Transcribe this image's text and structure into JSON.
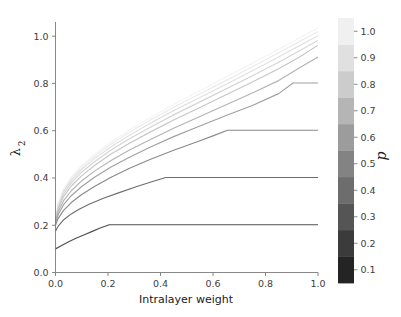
{
  "chart_data": {
    "type": "line",
    "title": "",
    "xlabel": "Intralayer weight",
    "ylabel": "λ2",
    "ylabel_base": "λ",
    "ylabel_sub": "2",
    "xlim": [
      0.0,
      1.0
    ],
    "ylim": [
      0.0,
      1.06
    ],
    "xticks": [
      0.0,
      0.2,
      0.4,
      0.6,
      0.8,
      1.0
    ],
    "xtick_labels": [
      "0.0",
      "0.2",
      "0.4",
      "0.6",
      "0.8",
      "1.0"
    ],
    "yticks": [
      0.0,
      0.2,
      0.4,
      0.6,
      0.8,
      1.0
    ],
    "ytick_labels": [
      "0.0",
      "0.2",
      "0.4",
      "0.6",
      "0.8",
      "1.0"
    ],
    "grid": false,
    "legend_position": "colorbar-right",
    "colormap": "Greys",
    "series": [
      {
        "name": "p = 0.1",
        "p": 0.1,
        "color": "#4f4f4f",
        "plateau_x": 0.205,
        "plateau_y": 0.202,
        "y_start": 0.1,
        "points": [
          [
            0.0,
            0.1
          ],
          [
            0.02,
            0.112
          ],
          [
            0.05,
            0.13
          ],
          [
            0.08,
            0.146
          ],
          [
            0.11,
            0.16
          ],
          [
            0.14,
            0.174
          ],
          [
            0.17,
            0.188
          ],
          [
            0.205,
            0.202
          ],
          [
            0.4,
            0.202
          ],
          [
            0.6,
            0.202
          ],
          [
            0.8,
            0.202
          ],
          [
            1.0,
            0.202
          ]
        ]
      },
      {
        "name": "p = 0.2",
        "p": 0.2,
        "color": "#6e6e6e",
        "plateau_x": 0.42,
        "plateau_y": 0.402,
        "y_start": 0.175,
        "points": [
          [
            0.0,
            0.175
          ],
          [
            0.01,
            0.196
          ],
          [
            0.03,
            0.222
          ],
          [
            0.06,
            0.248
          ],
          [
            0.09,
            0.268
          ],
          [
            0.13,
            0.29
          ],
          [
            0.18,
            0.313
          ],
          [
            0.24,
            0.337
          ],
          [
            0.31,
            0.364
          ],
          [
            0.37,
            0.385
          ],
          [
            0.42,
            0.402
          ],
          [
            0.6,
            0.402
          ],
          [
            0.8,
            0.402
          ],
          [
            1.0,
            0.402
          ]
        ]
      },
      {
        "name": "p = 0.3",
        "p": 0.3,
        "color": "#8a8a8a",
        "plateau_x": 0.655,
        "plateau_y": 0.602,
        "y_start": 0.2,
        "points": [
          [
            0.0,
            0.2
          ],
          [
            0.01,
            0.228
          ],
          [
            0.03,
            0.262
          ],
          [
            0.06,
            0.296
          ],
          [
            0.1,
            0.33
          ],
          [
            0.15,
            0.365
          ],
          [
            0.21,
            0.402
          ],
          [
            0.28,
            0.44
          ],
          [
            0.36,
            0.478
          ],
          [
            0.45,
            0.517
          ],
          [
            0.54,
            0.553
          ],
          [
            0.6,
            0.578
          ],
          [
            0.655,
            0.602
          ],
          [
            0.8,
            0.602
          ],
          [
            1.0,
            0.602
          ]
        ]
      },
      {
        "name": "p = 0.4",
        "p": 0.4,
        "color": "#a0a0a0",
        "plateau_x": 0.905,
        "plateau_y": 0.802,
        "y_start": 0.21,
        "points": [
          [
            0.0,
            0.21
          ],
          [
            0.01,
            0.244
          ],
          [
            0.03,
            0.286
          ],
          [
            0.06,
            0.325
          ],
          [
            0.1,
            0.364
          ],
          [
            0.15,
            0.404
          ],
          [
            0.21,
            0.445
          ],
          [
            0.28,
            0.487
          ],
          [
            0.36,
            0.53
          ],
          [
            0.45,
            0.575
          ],
          [
            0.55,
            0.62
          ],
          [
            0.65,
            0.664
          ],
          [
            0.75,
            0.707
          ],
          [
            0.85,
            0.757
          ],
          [
            0.905,
            0.802
          ],
          [
            1.0,
            0.802
          ]
        ]
      },
      {
        "name": "p = 0.5",
        "p": 0.5,
        "color": "#b4b4b4",
        "plateau_x": null,
        "plateau_y": null,
        "y_start": 0.215,
        "points": [
          [
            0.0,
            0.215
          ],
          [
            0.01,
            0.256
          ],
          [
            0.03,
            0.303
          ],
          [
            0.06,
            0.346
          ],
          [
            0.1,
            0.388
          ],
          [
            0.15,
            0.43
          ],
          [
            0.21,
            0.473
          ],
          [
            0.28,
            0.517
          ],
          [
            0.36,
            0.562
          ],
          [
            0.45,
            0.61
          ],
          [
            0.55,
            0.66
          ],
          [
            0.65,
            0.71
          ],
          [
            0.75,
            0.76
          ],
          [
            0.85,
            0.812
          ],
          [
            0.93,
            0.866
          ],
          [
            1.0,
            0.912
          ]
        ]
      },
      {
        "name": "p = 0.6",
        "p": 0.6,
        "color": "#c6c6c6",
        "plateau_x": null,
        "plateau_y": null,
        "y_start": 0.218,
        "points": [
          [
            0.0,
            0.218
          ],
          [
            0.01,
            0.268
          ],
          [
            0.03,
            0.32
          ],
          [
            0.06,
            0.366
          ],
          [
            0.1,
            0.41
          ],
          [
            0.15,
            0.454
          ],
          [
            0.21,
            0.5
          ],
          [
            0.28,
            0.546
          ],
          [
            0.36,
            0.594
          ],
          [
            0.45,
            0.645
          ],
          [
            0.55,
            0.698
          ],
          [
            0.65,
            0.752
          ],
          [
            0.75,
            0.806
          ],
          [
            0.85,
            0.862
          ],
          [
            0.93,
            0.912
          ],
          [
            1.0,
            0.962
          ]
        ]
      },
      {
        "name": "p = 0.7",
        "p": 0.7,
        "color": "#d4d4d4",
        "plateau_x": null,
        "plateau_y": null,
        "y_start": 0.22,
        "points": [
          [
            0.0,
            0.22
          ],
          [
            0.01,
            0.276
          ],
          [
            0.03,
            0.331
          ],
          [
            0.06,
            0.379
          ],
          [
            0.1,
            0.425
          ],
          [
            0.15,
            0.47
          ],
          [
            0.21,
            0.517
          ],
          [
            0.28,
            0.565
          ],
          [
            0.36,
            0.614
          ],
          [
            0.45,
            0.667
          ],
          [
            0.55,
            0.722
          ],
          [
            0.65,
            0.777
          ],
          [
            0.75,
            0.833
          ],
          [
            0.85,
            0.89
          ],
          [
            0.93,
            0.938
          ],
          [
            1.0,
            0.982
          ]
        ]
      },
      {
        "name": "p = 0.8",
        "p": 0.8,
        "color": "#e0e0e0",
        "plateau_x": null,
        "plateau_y": null,
        "y_start": 0.222,
        "points": [
          [
            0.0,
            0.222
          ],
          [
            0.01,
            0.282
          ],
          [
            0.03,
            0.34
          ],
          [
            0.06,
            0.39
          ],
          [
            0.1,
            0.437
          ],
          [
            0.15,
            0.483
          ],
          [
            0.21,
            0.531
          ],
          [
            0.28,
            0.58
          ],
          [
            0.36,
            0.631
          ],
          [
            0.45,
            0.685
          ],
          [
            0.55,
            0.741
          ],
          [
            0.65,
            0.797
          ],
          [
            0.75,
            0.854
          ],
          [
            0.85,
            0.912
          ],
          [
            0.93,
            0.96
          ],
          [
            1.0,
            1.002
          ]
        ]
      },
      {
        "name": "p = 0.9",
        "p": 0.9,
        "color": "#ebebeb",
        "plateau_x": null,
        "plateau_y": null,
        "y_start": 0.224,
        "points": [
          [
            0.0,
            0.224
          ],
          [
            0.01,
            0.288
          ],
          [
            0.03,
            0.347
          ],
          [
            0.06,
            0.398
          ],
          [
            0.1,
            0.446
          ],
          [
            0.15,
            0.493
          ],
          [
            0.21,
            0.542
          ],
          [
            0.28,
            0.592
          ],
          [
            0.36,
            0.644
          ],
          [
            0.45,
            0.699
          ],
          [
            0.55,
            0.756
          ],
          [
            0.65,
            0.813
          ],
          [
            0.75,
            0.871
          ],
          [
            0.85,
            0.93
          ],
          [
            0.93,
            0.978
          ],
          [
            1.0,
            1.02
          ]
        ]
      },
      {
        "name": "p = 1.0",
        "p": 1.0,
        "color": "#f4f4f4",
        "plateau_x": null,
        "plateau_y": null,
        "y_start": 0.226,
        "points": [
          [
            0.0,
            0.226
          ],
          [
            0.01,
            0.292
          ],
          [
            0.03,
            0.353
          ],
          [
            0.06,
            0.405
          ],
          [
            0.1,
            0.454
          ],
          [
            0.15,
            0.502
          ],
          [
            0.21,
            0.551
          ],
          [
            0.28,
            0.602
          ],
          [
            0.36,
            0.655
          ],
          [
            0.45,
            0.711
          ],
          [
            0.55,
            0.769
          ],
          [
            0.65,
            0.827
          ],
          [
            0.75,
            0.886
          ],
          [
            0.85,
            0.945
          ],
          [
            0.93,
            0.993
          ],
          [
            1.0,
            1.035
          ]
        ]
      }
    ],
    "colorbar": {
      "title": "p",
      "orientation": "vertical",
      "vmin": 0.05,
      "vmax": 1.05,
      "tick_values": [
        0.1,
        0.2,
        0.3,
        0.4,
        0.5,
        0.6,
        0.7,
        0.8,
        0.9,
        1.0
      ],
      "tick_labels": [
        "0.1",
        "0.2",
        "0.3",
        "0.4",
        "0.5",
        "0.6",
        "0.7",
        "0.8",
        "0.9",
        "1.0"
      ],
      "bands": [
        {
          "value": 0.1,
          "color": "#242424"
        },
        {
          "value": 0.2,
          "color": "#3b3b3b"
        },
        {
          "value": 0.3,
          "color": "#555555"
        },
        {
          "value": 0.4,
          "color": "#6d6d6d"
        },
        {
          "value": 0.5,
          "color": "#838383"
        },
        {
          "value": 0.6,
          "color": "#9c9c9c"
        },
        {
          "value": 0.7,
          "color": "#b5b5b5"
        },
        {
          "value": 0.8,
          "color": "#cccccc"
        },
        {
          "value": 0.9,
          "color": "#e0e0e0"
        },
        {
          "value": 1.0,
          "color": "#f0f0f0"
        }
      ]
    }
  },
  "figure": {
    "background_color": "#ffffff",
    "axis_color": "#7a7a7a",
    "text_color": "#1a1a1a"
  }
}
